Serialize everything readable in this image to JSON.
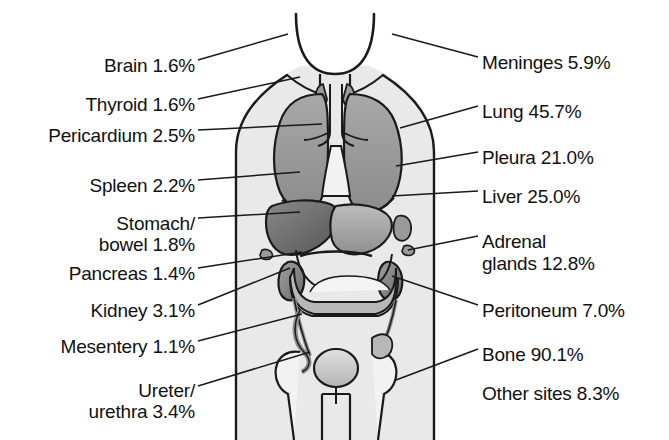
{
  "diagram": {
    "figure": "anterior human torso anatomical outline",
    "colors": {
      "body_fill": "#e9e9e9",
      "outline": "#1a1a1a",
      "organ_light": "#c9c9c9",
      "organ_mid": "#9a9a9a",
      "organ_dark": "#6e6e6e",
      "text": "#111111",
      "background": "#ffffff"
    },
    "left_labels": [
      {
        "name": "brain",
        "text": "Brain 1.6%",
        "x": 30,
        "y": 55,
        "width": 165
      },
      {
        "name": "thyroid",
        "text": "Thyroid 1.6%",
        "x": 30,
        "y": 94,
        "width": 165
      },
      {
        "name": "pericardium",
        "text": "Pericardium 2.5%",
        "x": 8,
        "y": 125,
        "width": 187
      },
      {
        "name": "spleen",
        "text": "Spleen 2.2%",
        "x": 30,
        "y": 175,
        "width": 165
      },
      {
        "name": "stomach-bowel",
        "text": "Stomach/",
        "x": 30,
        "y": 213,
        "width": 165
      },
      {
        "name": "stomach-bowel-2",
        "text": "bowel 1.8%",
        "x": 30,
        "y": 234,
        "width": 165
      },
      {
        "name": "pancreas",
        "text": "Pancreas 1.4%",
        "x": 30,
        "y": 263,
        "width": 165
      },
      {
        "name": "kidney",
        "text": "Kidney 3.1%",
        "x": 30,
        "y": 300,
        "width": 165
      },
      {
        "name": "mesentery",
        "text": "Mesentery 1.1%",
        "x": 18,
        "y": 336,
        "width": 177
      },
      {
        "name": "ureter",
        "text": "Ureter/",
        "x": 30,
        "y": 380,
        "width": 165
      },
      {
        "name": "urethra",
        "text": "urethra 3.4%",
        "x": 30,
        "y": 401,
        "width": 165
      }
    ],
    "right_labels": [
      {
        "name": "meninges",
        "text": "Meninges 5.9%",
        "x": 482,
        "y": 52
      },
      {
        "name": "lung",
        "text": "Lung 45.7%",
        "x": 482,
        "y": 101
      },
      {
        "name": "pleura",
        "text": "Pleura 21.0%",
        "x": 482,
        "y": 147
      },
      {
        "name": "liver",
        "text": "Liver 25.0%",
        "x": 482,
        "y": 186
      },
      {
        "name": "adrenal",
        "text": "Adrenal",
        "x": 482,
        "y": 231
      },
      {
        "name": "adrenal-2",
        "text": "glands 12.8%",
        "x": 482,
        "y": 253
      },
      {
        "name": "peritoneum",
        "text": "Peritoneum 7.0%",
        "x": 482,
        "y": 300
      },
      {
        "name": "bone",
        "text": "Bone 90.1%",
        "x": 482,
        "y": 344
      },
      {
        "name": "other-sites",
        "text": "Other sites 8.3%",
        "x": 482,
        "y": 383
      }
    ],
    "values": {
      "Brain": 1.6,
      "Thyroid": 1.6,
      "Pericardium": 2.5,
      "Spleen": 2.2,
      "Stomach/bowel": 1.8,
      "Pancreas": 1.4,
      "Kidney": 3.1,
      "Mesentery": 1.1,
      "Ureter/urethra": 3.4,
      "Meninges": 5.9,
      "Lung": 45.7,
      "Pleura": 21.0,
      "Liver": 25.0,
      "Adrenal glands": 12.8,
      "Peritoneum": 7.0,
      "Bone": 90.1,
      "Other sites": 8.3
    }
  }
}
